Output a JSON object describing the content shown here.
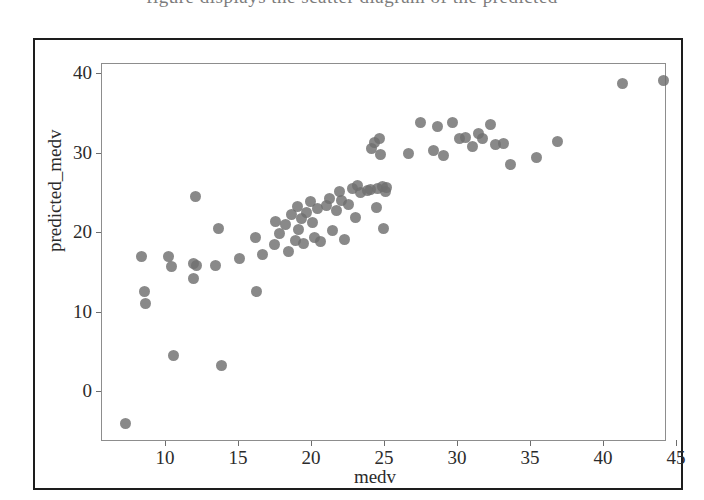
{
  "page": {
    "top_text_fragment": "figure displays the scatter diagram of the predicted"
  },
  "chart_data": {
    "type": "scatter",
    "title": "",
    "xlabel": "medv",
    "ylabel": "predicted_medv",
    "xlim": [
      6.2,
      46.8
    ],
    "ylim": [
      -6.5,
      41.5
    ],
    "xticks": [
      10,
      15,
      20,
      25,
      30,
      35,
      40,
      45
    ],
    "yticks": [
      0,
      10,
      20,
      30,
      40
    ],
    "grid": false,
    "legend": null,
    "marker": {
      "shape": "circle",
      "color": "#6f6f6f",
      "size": 11,
      "alpha": 0.82
    },
    "series": [
      {
        "name": "predicted vs actual",
        "points": [
          [
            7.2,
            -4.0
          ],
          [
            8.3,
            17.1
          ],
          [
            8.5,
            12.6
          ],
          [
            8.6,
            11.2
          ],
          [
            10.2,
            17.1
          ],
          [
            10.4,
            15.8
          ],
          [
            10.5,
            4.6
          ],
          [
            11.9,
            14.3
          ],
          [
            11.9,
            16.2
          ],
          [
            12.0,
            24.6
          ],
          [
            12.1,
            15.9
          ],
          [
            13.4,
            15.9
          ],
          [
            13.6,
            20.6
          ],
          [
            13.8,
            3.3
          ],
          [
            15.0,
            16.8
          ],
          [
            16.1,
            19.5
          ],
          [
            16.2,
            12.7
          ],
          [
            16.6,
            17.3
          ],
          [
            17.4,
            18.6
          ],
          [
            17.5,
            21.5
          ],
          [
            17.8,
            20.0
          ],
          [
            18.2,
            21.1
          ],
          [
            18.4,
            17.7
          ],
          [
            18.6,
            22.3
          ],
          [
            18.9,
            19.1
          ],
          [
            19.0,
            23.3
          ],
          [
            19.1,
            20.5
          ],
          [
            19.3,
            21.8
          ],
          [
            19.4,
            18.7
          ],
          [
            19.6,
            22.6
          ],
          [
            19.9,
            24.0
          ],
          [
            20.0,
            21.3
          ],
          [
            20.2,
            19.4
          ],
          [
            20.4,
            23.1
          ],
          [
            20.6,
            18.9
          ],
          [
            21.0,
            23.5
          ],
          [
            21.2,
            24.4
          ],
          [
            21.4,
            20.3
          ],
          [
            21.7,
            22.8
          ],
          [
            21.9,
            25.3
          ],
          [
            22.0,
            24.1
          ],
          [
            22.2,
            19.2
          ],
          [
            22.5,
            23.6
          ],
          [
            22.8,
            25.6
          ],
          [
            23.0,
            22.0
          ],
          [
            23.1,
            26.0
          ],
          [
            23.3,
            25.1
          ],
          [
            23.8,
            25.4
          ],
          [
            24.0,
            25.5
          ],
          [
            24.1,
            30.7
          ],
          [
            24.3,
            31.4
          ],
          [
            24.4,
            23.2
          ],
          [
            24.5,
            25.6
          ],
          [
            24.6,
            31.9
          ],
          [
            24.7,
            29.9
          ],
          [
            24.8,
            25.9
          ],
          [
            24.9,
            20.6
          ],
          [
            25.0,
            25.2
          ],
          [
            25.1,
            25.8
          ],
          [
            26.6,
            30.0
          ],
          [
            27.4,
            33.9
          ],
          [
            28.3,
            30.4
          ],
          [
            28.6,
            33.5
          ],
          [
            29.0,
            29.8
          ],
          [
            29.6,
            33.9
          ],
          [
            30.1,
            31.9
          ],
          [
            30.5,
            32.1
          ],
          [
            31.0,
            30.9
          ],
          [
            31.4,
            32.5
          ],
          [
            31.7,
            31.9
          ],
          [
            32.2,
            33.7
          ],
          [
            32.6,
            31.2
          ],
          [
            33.1,
            31.3
          ],
          [
            33.6,
            28.6
          ],
          [
            35.4,
            29.5
          ],
          [
            36.8,
            31.6
          ],
          [
            41.3,
            38.8
          ],
          [
            44.1,
            39.2
          ]
        ]
      }
    ]
  },
  "axes": {
    "x_pixel_origin": 165,
    "x_pixels_per_unit": 14.6,
    "y_pixel_origin": 391,
    "y_pixels_per_unit": 7.94
  }
}
